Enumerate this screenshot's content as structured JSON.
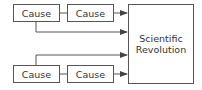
{
  "diagram": {
    "causes": [
      {
        "label": "Cause"
      },
      {
        "label": "Cause"
      },
      {
        "label": "Cause"
      },
      {
        "label": "Cause"
      }
    ],
    "result": {
      "label_line1": "Scientific",
      "label_line2": "Revolution"
    },
    "colors": {
      "stroke": "#555555",
      "text": "#333333",
      "background": "#ffffff"
    }
  }
}
